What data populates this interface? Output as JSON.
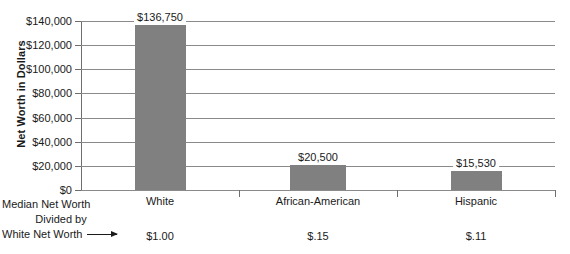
{
  "chart_data": {
    "type": "bar",
    "title": "",
    "xlabel": "",
    "ylabel": "Net Worth in Dollars",
    "categories": [
      "White",
      "African-American",
      "Hispanic"
    ],
    "values": [
      136750,
      20500,
      15530
    ],
    "value_labels": [
      "$136,750",
      "$20,500",
      "$15,530"
    ],
    "ratio_labels": [
      "$1.00",
      "$.15",
      "$.11"
    ],
    "ratio_caption_lines": [
      "Median Net Worth",
      "Divided by",
      "White Net Worth"
    ],
    "ylim": [
      0,
      140000
    ],
    "ytick_labels": [
      "$0",
      "$20,000",
      "$40,000",
      "$60,000",
      "$80,000",
      "$100,000",
      "$120,000",
      "$140,000"
    ],
    "ytick_values": [
      0,
      20000,
      40000,
      60000,
      80000,
      100000,
      120000,
      140000
    ],
    "grid": true,
    "legend": "none",
    "bar_color": "#808080",
    "grid_color": "#8a8a8a",
    "axis_color": "#6e6e6e",
    "text_color": "#1a1a1a"
  }
}
